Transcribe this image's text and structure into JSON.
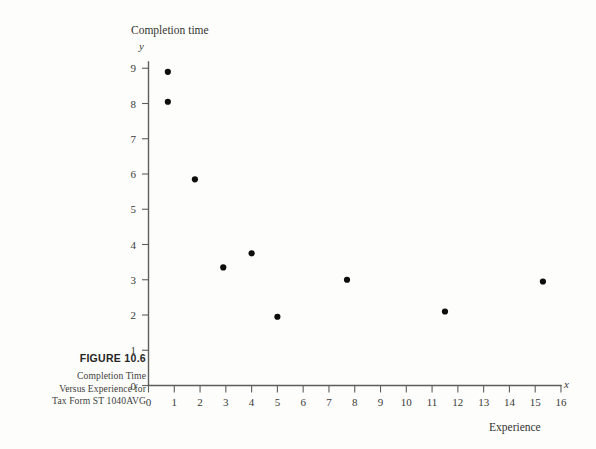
{
  "figure": {
    "number_label": "FIGURE 10.6",
    "caption_lines": [
      "Completion Time",
      "Versus Experience for",
      "Tax Form ST 1040AVG"
    ]
  },
  "chart_data": {
    "type": "scatter",
    "title": "Completion time",
    "xlabel": "Experience",
    "ylabel": "Completion time",
    "x_axis_symbol": "x",
    "y_axis_symbol": "y",
    "xlim": [
      0,
      16
    ],
    "ylim": [
      0,
      9
    ],
    "grid": false,
    "legend": null,
    "x_ticks": [
      "0",
      "1",
      "2",
      "3",
      "4",
      "5",
      "6",
      "7",
      "8",
      "9",
      "10",
      "11",
      "12",
      "13",
      "14",
      "15",
      "16"
    ],
    "y_ticks": [
      "0",
      "1",
      "2",
      "3",
      "4",
      "5",
      "6",
      "7",
      "8",
      "9"
    ],
    "points": [
      {
        "x": 0.75,
        "y": 8.9
      },
      {
        "x": 0.75,
        "y": 8.05
      },
      {
        "x": 1.8,
        "y": 5.85
      },
      {
        "x": 2.9,
        "y": 3.35
      },
      {
        "x": 4.0,
        "y": 3.75
      },
      {
        "x": 5.0,
        "y": 1.95
      },
      {
        "x": 7.7,
        "y": 3.0
      },
      {
        "x": 11.5,
        "y": 2.1
      },
      {
        "x": 15.3,
        "y": 2.95
      }
    ],
    "marker": {
      "shape": "circle",
      "size_px": 3.1,
      "color": "#0d0d0d"
    }
  },
  "colors": {
    "background": "#fdfdfb",
    "axis": "#5e5e5c",
    "text": "#3a3a38",
    "marker": "#0d0d0d"
  }
}
